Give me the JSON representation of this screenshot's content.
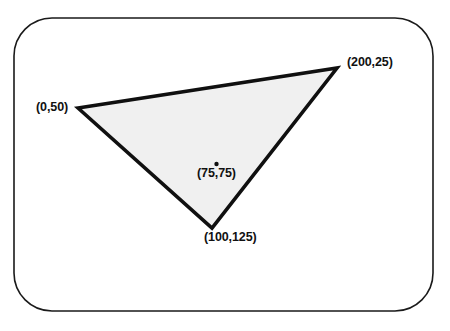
{
  "figure": {
    "kind": "geometry-diagram",
    "background_color": "#ffffff",
    "border": {
      "name": "rounded-frame",
      "stroke_color": "#1a1a1a",
      "stroke_width": 1.6,
      "corner_radius": 38,
      "x": 14,
      "y": 18,
      "width": 419,
      "height": 293,
      "fill": "none"
    },
    "shape": {
      "name": "triangle",
      "fill_color": "#f0f0f0",
      "stroke_color": "#101010",
      "stroke_width": 3.6,
      "points": "78,108 337,68 212,228",
      "vertices": [
        {
          "id": "v1",
          "px": 78,
          "py": 108,
          "label": "(0,50)"
        },
        {
          "id": "v2",
          "px": 337,
          "py": 68,
          "label": "(200,25)"
        },
        {
          "id": "v3",
          "px": 212,
          "py": 228,
          "label": "(100,125)"
        }
      ]
    },
    "marker": {
      "name": "centroid-dot",
      "px": 216.5,
      "py": 164,
      "radius": 2.2,
      "color": "#101010"
    }
  },
  "labels": {
    "v1": "(0,50)",
    "v2": "(200,25)",
    "v3": "(100,125)",
    "centroid": "(75,75)"
  },
  "chart_data": {
    "type": "scatter",
    "title": "",
    "xlabel": "",
    "ylabel": "",
    "annotations": [
      "(0,50)",
      "(200,25)",
      "(100,125)",
      "(75,75)"
    ],
    "polygon": {
      "name": "triangle",
      "closed": true,
      "x": [
        0,
        200,
        100
      ],
      "y": [
        50,
        25,
        125
      ],
      "point_labels": [
        "(0,50)",
        "(200,25)",
        "(100,125)"
      ]
    },
    "points": [
      {
        "x": 0,
        "y": 50,
        "label": "(0,50)"
      },
      {
        "x": 200,
        "y": 25,
        "label": "(200,25)"
      },
      {
        "x": 100,
        "y": 125,
        "label": "(100,125)"
      },
      {
        "x": 75,
        "y": 75,
        "label": "(75,75)"
      }
    ],
    "grid": false,
    "legend": "none"
  }
}
